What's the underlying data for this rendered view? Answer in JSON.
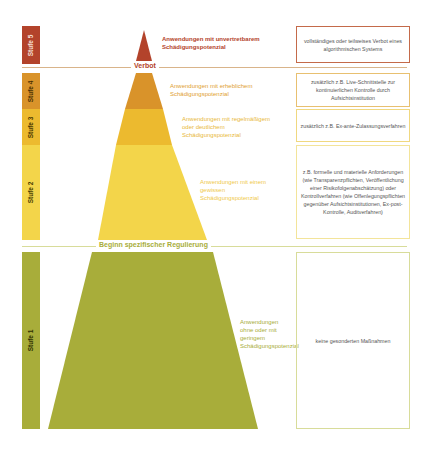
{
  "levels": [
    {
      "stufe": "Stufe 5",
      "description": "Anwendungen mit unvertretbarem Schädigungspotenzial",
      "measure": "vollständiges oder teilweises Verbot eines algorithmischen Systems",
      "color": "#b3432b",
      "text_color": "#b3432b"
    },
    {
      "stufe": "Stufe 4",
      "description": "Anwendungen mit erheblichem Schädigungspotenzial",
      "measure": "zusätzlich z.B. Live-Schnittstelle zur kontinuierlichen Kontrolle durch Aufsichtsinstitution",
      "color": "#d9932a",
      "text_color": "#e0a030"
    },
    {
      "stufe": "Stufe 3",
      "description": "Anwendungen mit regelmäßigem oder deutlichem Schädigungspotenzial",
      "measure": "zusätzlich z.B. Ex-ante-Zulassungsverfahren",
      "color": "#ecba2f",
      "text_color": "#e8b83a"
    },
    {
      "stufe": "Stufe 2",
      "description": "Anwendungen mit einem gewissen Schädigungspotenzial",
      "measure": "z.B. formelle und materielle Anforderungen (wie Transparenzpflichten, Veröffentlichung einer Risikofolgenabschätzung) oder Kontrollverfahren (wie Offenlegungspflichten gegenüber Aufsichtsinstitutionen, Ex-post-Kontrolle, Auditverfahren)",
      "color": "#f3d54a",
      "text_color": "#efc94a"
    },
    {
      "stufe": "Stufe 1",
      "description": "Anwendungen ohne oder mit geringem Schädigungspotenzial",
      "measure": "keine gesonderten Maßnahmen",
      "color": "#a8ad3a",
      "text_color": "#a8ad3a"
    }
  ],
  "dividers": {
    "verbot": "Verbot",
    "regulierung": "Beginn spezifischer Regulierung"
  }
}
